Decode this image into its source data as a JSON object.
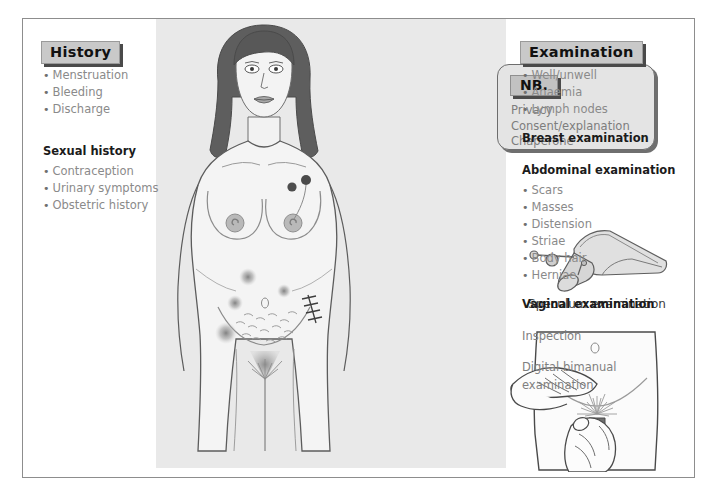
{
  "figure": {
    "panel_color": "#e9e9e9",
    "border_color": "#8d8d8d"
  },
  "left_column": {
    "heading": "History",
    "items": [
      "Menstruation",
      "Bleeding",
      "Discharge"
    ],
    "subsection": {
      "heading": "Sexual history",
      "items": [
        "Contraception",
        "Urinary symptoms",
        "Obstetric history"
      ]
    }
  },
  "nb_callout": {
    "label": "NB.",
    "items": [
      "Privacy",
      "Consent/explanation",
      "Chaperone"
    ]
  },
  "right_column": {
    "heading": "Examination",
    "items": [
      "Well/unwell",
      "Anaemia",
      "Lymph nodes"
    ],
    "sections": [
      {
        "heading": "Breast examination",
        "items": []
      },
      {
        "heading": "Abdominal examination",
        "items": [
          "Scars",
          "Masses",
          "Distension",
          "Striae",
          "Body hair",
          "Herniae"
        ]
      },
      {
        "heading": "Vaginal examination",
        "plain": [
          "Inspection",
          "Digital bimanual",
          "examination"
        ]
      }
    ]
  },
  "illustrations": {
    "figure_female": "female-torso-illustration",
    "speculum": "speculum-instrument-illustration",
    "speculum_caption": "Speculum examination",
    "bimanual": "bimanual-examination-illustration"
  }
}
